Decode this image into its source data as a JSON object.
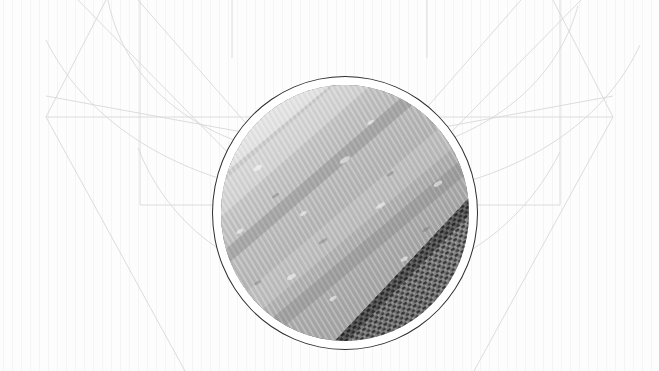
{
  "canvas": {
    "width": 659,
    "height": 371,
    "background_color": "#fdfdfd",
    "paper_tone": "#f6f6f6"
  },
  "palette": {
    "background": "#fdfdfd",
    "construction_line": "#d8d8d8",
    "construction_line_faint": "#e4e4e4",
    "medallion_ring": "#2e2e2e",
    "medallion_matte": "#ffffff",
    "photo_highlight": "#e9e9e9",
    "photo_midtone": "#a8a8a8",
    "photo_shadow": "#5a5a5a",
    "mesh_dark": "#4a4a4a",
    "mesh_light": "#c9c9c9"
  },
  "medallion": {
    "name": "circular-photo-medallion",
    "center_x": 345,
    "center_y": 209,
    "outer_diameter": 266,
    "ring_stroke_width": 1.1,
    "matte_gap": 9,
    "subject": "grayscale macro photograph of a translucent fibrous strip resting diagonally on a woven mesh screen",
    "caption": ""
  },
  "construction_geometry": {
    "description": "faint pale-grey draughting lines forming a symmetric wireframe behind the medallion",
    "left_vertex": {
      "x": 46,
      "y": 117
    },
    "right_vertex": {
      "x": 613,
      "y": 117
    },
    "horizontal_rule_upper": {
      "y": 117,
      "x1": 46,
      "x2": 613
    },
    "horizontal_rule_lower": {
      "y": 205,
      "x1": 140,
      "x2": 560
    },
    "vertical_rule_left": {
      "x": 140,
      "y1": 0,
      "y2": 205
    },
    "vertical_rule_right": {
      "x": 560,
      "y1": 0,
      "y2": 205
    },
    "arc_sweep": "wide shallow parabola dipping toward the lower centre of the frame"
  },
  "annotations": {
    "title": "",
    "subtitle": "",
    "page_number": "",
    "footer": ""
  },
  "chart_data": {
    "type": "scatter",
    "title": "",
    "xlabel": "",
    "ylabel": "",
    "series": []
  }
}
